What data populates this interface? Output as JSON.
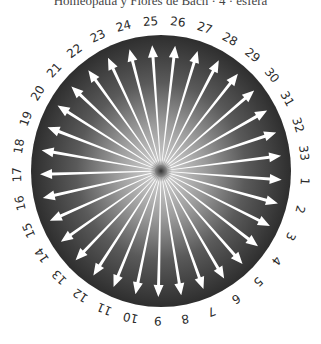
{
  "header": {
    "title": "Homeopatía y Flores de Bach · 4 · esfera"
  },
  "dial": {
    "center": [
      161,
      171
    ],
    "disk_radius": [
      130,
      136
    ],
    "arrow_radius": [
      121,
      126
    ],
    "label_radius": [
      144,
      150
    ],
    "start_angle_deg": 4,
    "direction": "clockwise",
    "colors": {
      "disk_outer": "#2e2e2e",
      "disk_mid": "#5a5a5a",
      "disk_inner": "#d9d9d9",
      "center_dot": "#3a3a3a",
      "arrow": "#ffffff",
      "label": "#2b2b2b"
    },
    "labels": [
      "1",
      "2",
      "3",
      "4",
      "5",
      "6",
      "7",
      "8",
      "9",
      "10",
      "11",
      "12",
      "13",
      "14",
      "15",
      "16",
      "17",
      "18",
      "19",
      "20",
      "21",
      "22",
      "23",
      "24",
      "25",
      "26",
      "27",
      "28",
      "29",
      "30",
      "31",
      "32",
      "33"
    ]
  }
}
